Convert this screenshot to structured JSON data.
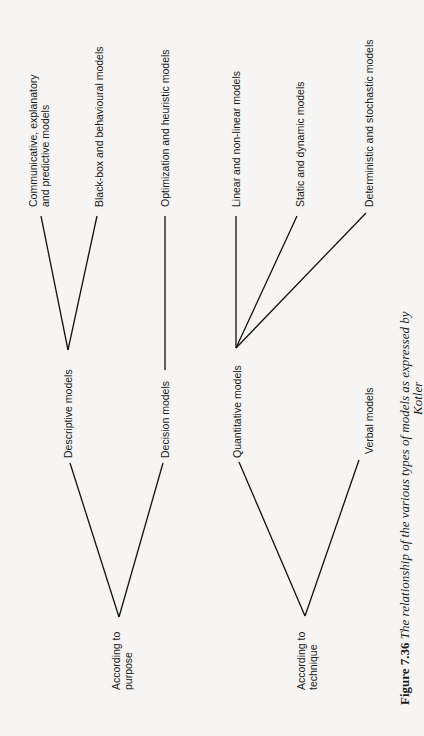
{
  "diagram": {
    "roots": [
      {
        "label_line1": "According to",
        "label_line2": "purpose"
      },
      {
        "label_line1": "According to",
        "label_line2": "technique"
      }
    ],
    "level2": {
      "descriptive": "Descriptive models",
      "decision": "Decision models",
      "quantitative": "Quantitative models",
      "verbal": "Verbal models"
    },
    "level3": {
      "communicative_line1": "Communicative, explanatory",
      "communicative_line2": "and predictive models",
      "blackbox": "Black-box and behavioural models",
      "optimization": "Optimization and heuristic models",
      "linear": "Linear and non-linear models",
      "static": "Static and dynamic models",
      "deterministic": "Deterministic and stochastic models"
    }
  },
  "caption": {
    "figure_label": "Figure 7.36",
    "text": "The relationship of the various types of models as expressed by",
    "line2": "Kotler"
  }
}
